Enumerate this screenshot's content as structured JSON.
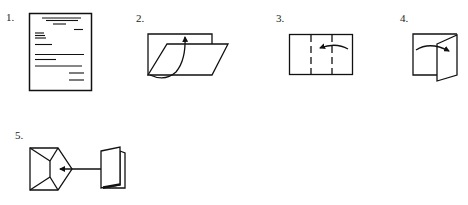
{
  "diagram": {
    "steps": [
      {
        "number": "1.",
        "description": "Typed letter page"
      },
      {
        "number": "2.",
        "description": "Fold bottom edge up toward top"
      },
      {
        "number": "3.",
        "description": "Fold right third over to the left along dashed lines"
      },
      {
        "number": "4.",
        "description": "Fold left panel over to the right"
      },
      {
        "number": "5.",
        "description": "Insert folded letter into envelope"
      }
    ]
  }
}
